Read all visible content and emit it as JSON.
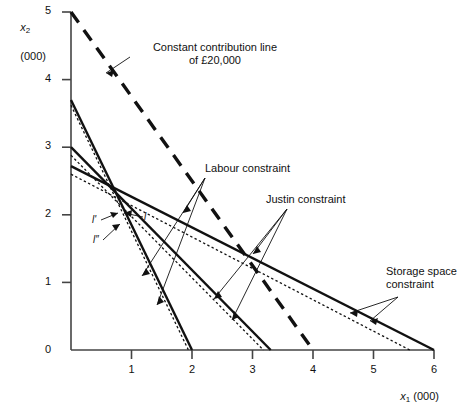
{
  "figure": {
    "background": "#ffffff",
    "ink": "#111111"
  },
  "axes": {
    "x": {
      "label_symbol": "x",
      "label_sub": "1",
      "label_unit": "(000)",
      "ticks": [
        "0",
        "1",
        "2",
        "3",
        "4",
        "5",
        "6"
      ],
      "min": 0,
      "max": 6
    },
    "y": {
      "label_symbol": "x",
      "label_sub": "2",
      "label_unit": "(000)",
      "ticks": [
        "0",
        "1",
        "2",
        "3",
        "4",
        "5"
      ],
      "min": 0,
      "max": 5
    }
  },
  "annotations": {
    "contribution": "Constant contribution line\nof £20,000",
    "labour": "Labour constraint",
    "justin": "Justin constraint",
    "storage": "Storage space\nconstraint",
    "point_l": "l",
    "point_l_prime": "l'",
    "point_l_double_prime": "l″"
  },
  "chart_data": {
    "type": "line",
    "title": "",
    "xlabel": "x1 (000)",
    "ylabel": "x2 (000)",
    "xlim": [
      0,
      6
    ],
    "ylim": [
      0,
      5
    ],
    "grid": false,
    "legend": "none",
    "series": [
      {
        "name": "Labour constraint",
        "style": "solid",
        "width": 2.2,
        "points": [
          [
            0,
            3.7
          ],
          [
            2.0,
            0
          ]
        ]
      },
      {
        "name": "Labour constraint (shifted)",
        "style": "dotted",
        "width": 1.2,
        "points": [
          [
            0,
            3.62
          ],
          [
            1.94,
            0
          ]
        ]
      },
      {
        "name": "Justin constraint",
        "style": "solid",
        "width": 2.2,
        "points": [
          [
            0,
            3.0
          ],
          [
            3.3,
            0
          ]
        ]
      },
      {
        "name": "Justin constraint (shifted)",
        "style": "dotted",
        "width": 1.2,
        "points": [
          [
            0,
            2.88
          ],
          [
            3.18,
            0
          ]
        ]
      },
      {
        "name": "Storage space constraint",
        "style": "solid",
        "width": 2.2,
        "points": [
          [
            0,
            2.72
          ],
          [
            6.0,
            0
          ]
        ]
      },
      {
        "name": "Storage space constraint (shifted)",
        "style": "dotted",
        "width": 1.2,
        "points": [
          [
            0,
            2.6
          ],
          [
            5.6,
            0
          ]
        ]
      },
      {
        "name": "Constant contribution line of £20,000",
        "style": "dashed",
        "width": 3.2,
        "points": [
          [
            0,
            5.0
          ],
          [
            4.0,
            0
          ]
        ]
      }
    ],
    "annotated_points": [
      {
        "label": "l",
        "x": 1.0,
        "y": 1.95
      },
      {
        "label": "l'",
        "x": 0.92,
        "y": 1.88
      },
      {
        "label": "l″",
        "x": 1.02,
        "y": 1.76
      }
    ]
  }
}
